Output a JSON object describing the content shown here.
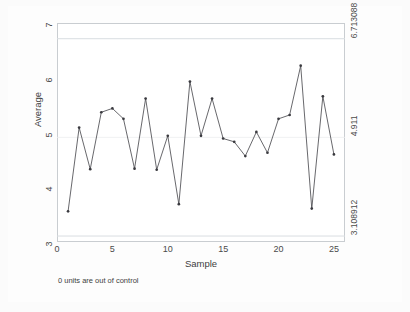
{
  "chart_data": {
    "type": "line",
    "title": "",
    "subtitle": "",
    "xlabel": "Sample",
    "ylabel": "Average",
    "x": [
      1,
      2,
      3,
      4,
      5,
      6,
      7,
      8,
      9,
      10,
      11,
      12,
      13,
      14,
      15,
      16,
      17,
      18,
      19,
      20,
      21,
      22,
      23,
      24,
      25
    ],
    "series": [
      {
        "name": "Average",
        "values": [
          3.56,
          5.09,
          4.33,
          5.37,
          5.44,
          5.25,
          4.34,
          5.62,
          4.32,
          4.94,
          3.69,
          5.93,
          4.94,
          5.62,
          4.89,
          4.83,
          4.57,
          5.01,
          4.63,
          5.25,
          5.32,
          6.22,
          3.61,
          5.66,
          4.6
        ]
      }
    ],
    "xlim": [
      0,
      26
    ],
    "ylim": [
      3,
      7
    ],
    "xticks": [
      0,
      5,
      10,
      15,
      20,
      25
    ],
    "xtick_labels": [
      "0",
      "5",
      "10",
      "15",
      "20",
      "25"
    ],
    "yticks": [
      3,
      4,
      5,
      6,
      7
    ],
    "ytick_labels": [
      "3",
      "4",
      "5",
      "6",
      "7"
    ],
    "y2ticks": [
      3.108912,
      4.911,
      6.713088
    ],
    "y2tick_labels": [
      "3.108912",
      "4.911",
      "6.713088"
    ],
    "reference_lines": [
      {
        "name": "lcl",
        "value": 3.108912,
        "label": "3.108912"
      },
      {
        "name": "center",
        "value": 4.911,
        "label": "4.911"
      },
      {
        "name": "ucl",
        "value": 6.713088,
        "label": "6.713088"
      }
    ],
    "grid": false,
    "legend": "none",
    "annotation": "0 units are out of control",
    "colors": {
      "line": "#4d4d52",
      "marker": "#3a3a3f",
      "control_limit": "#d9dde1",
      "center_line": "#eceef0",
      "plot_border": "#c9cdd1",
      "plot_background": "#ffffff",
      "graph_background": "#fdfdfd",
      "axis_text": "#4a4a4a"
    }
  }
}
